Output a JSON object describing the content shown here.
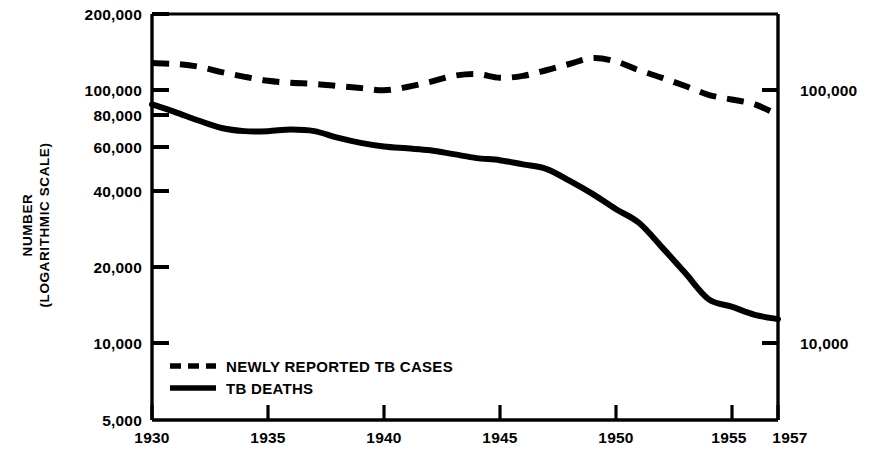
{
  "chart_data": {
    "type": "line",
    "title": "",
    "subtitle": "",
    "xlabel": "",
    "ylabel": "NUMBER (LOGARITHMIC SCALE)",
    "ylabel_lines": [
      "NUMBER",
      "(LOGARITHMIC SCALE)"
    ],
    "yscale": "log",
    "ylim": [
      5000,
      200000
    ],
    "xlim": [
      1930,
      1957
    ],
    "grid": false,
    "legend_position": "bottom-left",
    "y_tick_labels": [
      "200,000",
      "100,000",
      "80,000",
      "60,000",
      "40,000",
      "20,000",
      "10,000",
      "5,000"
    ],
    "y_tick_values": [
      200000,
      100000,
      80000,
      60000,
      40000,
      20000,
      10000,
      5000
    ],
    "y_tick_labels_right": [
      "100,000",
      "10,000"
    ],
    "y_tick_values_right": [
      100000,
      10000
    ],
    "x_tick_labels": [
      "1930",
      "1935",
      "1940",
      "1945",
      "1950",
      "1955",
      "1957"
    ],
    "x_tick_values": [
      1930,
      1935,
      1940,
      1945,
      1950,
      1955,
      1957
    ],
    "x": [
      1930,
      1931,
      1932,
      1933,
      1934,
      1935,
      1936,
      1937,
      1938,
      1939,
      1940,
      1941,
      1942,
      1943,
      1944,
      1945,
      1946,
      1947,
      1948,
      1949,
      1950,
      1951,
      1952,
      1953,
      1954,
      1955,
      1956,
      1957
    ],
    "series": [
      {
        "name": "NEWLY REPORTED TB CASES",
        "style": "dashed",
        "color": "#000000",
        "values": [
          128000,
          127000,
          124000,
          118000,
          113000,
          109000,
          107000,
          106000,
          104000,
          102000,
          100000,
          103000,
          108000,
          114000,
          116000,
          112000,
          114000,
          120000,
          127000,
          134000,
          130000,
          120000,
          112000,
          104000,
          96000,
          92000,
          88000,
          80000
        ]
      },
      {
        "name": "TB DEATHS",
        "style": "solid",
        "color": "#000000",
        "values": [
          88000,
          82000,
          76000,
          71000,
          69000,
          69000,
          70000,
          69000,
          65000,
          62000,
          60000,
          59000,
          58000,
          56000,
          54000,
          53000,
          51000,
          49000,
          44000,
          39000,
          34000,
          30000,
          24000,
          19000,
          15000,
          14000,
          13000,
          12500
        ]
      }
    ],
    "legend_entries": [
      {
        "label": "NEWLY REPORTED TB CASES",
        "style": "dashed"
      },
      {
        "label": "TB DEATHS",
        "style": "solid"
      }
    ]
  },
  "colors": {
    "ink": "#000000",
    "background": "#ffffff"
  }
}
